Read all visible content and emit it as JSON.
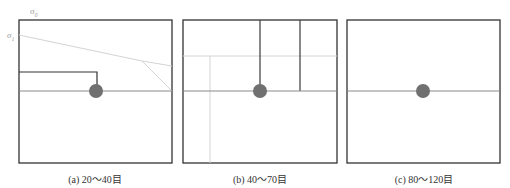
{
  "figure": {
    "panels": [
      {
        "id": "a",
        "caption": "(a) 20～40目",
        "mesh_range": "20～40目",
        "frame": {
          "x": 19,
          "y": 20,
          "w": 153,
          "h": 143
        },
        "particle": {
          "cx": 96,
          "cy": 91,
          "r": 7
        },
        "labels": {
          "sigma_0": "σ",
          "sigma_0_sub": "0",
          "sigma_1": "σ",
          "sigma_1_sub": "1"
        }
      },
      {
        "id": "b",
        "caption": "(b) 40～70目",
        "mesh_range": "40～70目",
        "frame": {
          "x": 183,
          "y": 20,
          "w": 154,
          "h": 143
        },
        "particle": {
          "cx": 260,
          "cy": 91,
          "r": 7
        }
      },
      {
        "id": "c",
        "caption": "(c) 80～120目",
        "mesh_range": "80～120目",
        "frame": {
          "x": 347,
          "y": 20,
          "w": 153,
          "h": 143
        },
        "particle": {
          "cx": 423,
          "cy": 91,
          "r": 7
        }
      }
    ],
    "colors": {
      "frame": "#333333",
      "dark_line": "#3a3a3a",
      "mid_line": "#8a8a8a",
      "light_line": "#d0d0d0",
      "particle": "#707070"
    }
  }
}
